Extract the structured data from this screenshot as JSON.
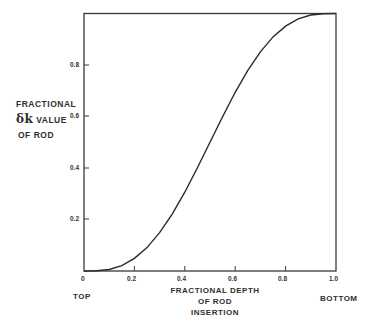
{
  "chart_data": {
    "type": "line",
    "title": "",
    "xlabel": "FRACTIONAL DEPTH OF ROD INSERTION",
    "ylabel": "FRACTIONAL δk VALUE OF ROD",
    "xlim": [
      0,
      1.0
    ],
    "ylim": [
      0,
      1.0
    ],
    "x_ticks": [
      "0",
      "0.2",
      "0.4",
      "0.6",
      "0.8",
      "1.0"
    ],
    "y_ticks": [
      "0.2",
      "0.4",
      "0.6",
      "0.8"
    ],
    "x_end_labels": {
      "left": "TOP",
      "right": "BOTTOM"
    },
    "grid": false,
    "legend": null,
    "series": [
      {
        "name": "Fractional δk value of rod",
        "x": [
          0,
          0.05,
          0.1,
          0.15,
          0.2,
          0.25,
          0.3,
          0.35,
          0.4,
          0.45,
          0.5,
          0.55,
          0.6,
          0.65,
          0.7,
          0.75,
          0.8,
          0.85,
          0.9,
          0.95,
          1.0
        ],
        "y": [
          0,
          0.001,
          0.006,
          0.021,
          0.049,
          0.091,
          0.149,
          0.221,
          0.306,
          0.401,
          0.5,
          0.599,
          0.694,
          0.779,
          0.851,
          0.909,
          0.951,
          0.979,
          0.994,
          0.999,
          1.0
        ]
      }
    ]
  },
  "labels": {
    "y_line1": "FRACTIONAL",
    "y_line2_symbol": "δk",
    "y_line2_text": "VALUE",
    "y_line3": "OF ROD",
    "x_line1": "FRACTIONAL DEPTH",
    "x_line2": "OF ROD",
    "x_line3": "INSERTION",
    "left_end": "TOP",
    "right_end": "BOTTOM"
  },
  "ticks": {
    "x": [
      "0",
      "0.2",
      "0.4",
      "0.6",
      "0.8",
      "1.0"
    ],
    "y": [
      "0.8",
      "0.6",
      "0.4",
      "0.2"
    ]
  }
}
